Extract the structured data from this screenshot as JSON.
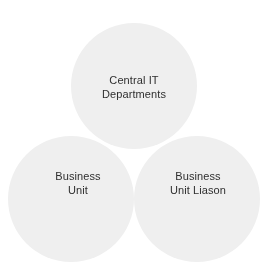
{
  "diagram": {
    "type": "venn-3-circle",
    "title": "",
    "background_color": "#ffffff",
    "circle_fill_color": "#efefef",
    "overlap_two_color": "#e2e2e2",
    "overlap_three_color": "#d6d6d6",
    "text_color": "#2f2f2f",
    "sets": [
      {
        "id": "central-it-departments",
        "position": "top",
        "center_x": 134,
        "center_y": 86,
        "radius": 63,
        "label_lines": [
          "Central IT",
          "Departments"
        ],
        "label_line1": "Central IT",
        "label_line2": "Departments"
      },
      {
        "id": "business-unit",
        "position": "bottom-left",
        "center_x": 71,
        "center_y": 199,
        "radius": 63,
        "label_lines": [
          "Business",
          "Unit"
        ],
        "label_line1": "Business",
        "label_line2": "Unit"
      },
      {
        "id": "business-unit-liason",
        "position": "bottom-right",
        "center_x": 197,
        "center_y": 199,
        "radius": 63,
        "label_lines": [
          "Business",
          "Unit Liason"
        ],
        "label_line1": "Business",
        "label_line2": "Unit Liason"
      }
    ]
  }
}
